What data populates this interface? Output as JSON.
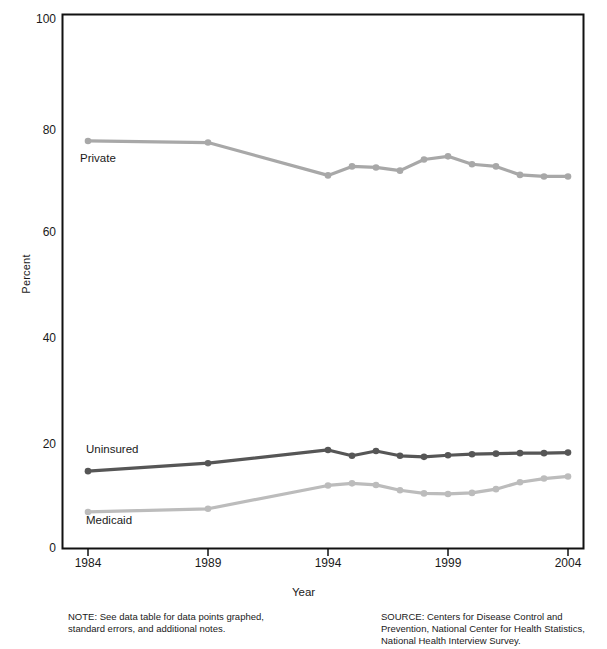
{
  "chart_data": {
    "type": "line",
    "title": "",
    "xlabel": "Year",
    "ylabel": "Percent",
    "ylim": [
      0,
      100
    ],
    "xlim": [
      1984,
      2004
    ],
    "yticks": [
      0,
      20,
      40,
      60,
      80,
      100
    ],
    "xticks": [
      1984,
      1989,
      1994,
      1999,
      2004
    ],
    "grid": false,
    "legend_position": "inline-labels",
    "x": [
      1984,
      1989,
      1994,
      1995,
      1996,
      1997,
      1998,
      1999,
      2000,
      2001,
      2002,
      2003,
      2004
    ],
    "series": [
      {
        "name": "Private",
        "color": "#a8a8a8",
        "values": [
          76.8,
          76.5,
          70.3,
          72.0,
          71.8,
          71.2,
          73.3,
          73.9,
          72.4,
          72.0,
          70.4,
          70.1,
          70.1
        ]
      },
      {
        "name": "Uninsured",
        "color": "#565656",
        "values": [
          14.5,
          16.0,
          18.5,
          17.4,
          18.3,
          17.4,
          17.2,
          17.5,
          17.7,
          17.8,
          17.9,
          17.9,
          18.0
        ]
      },
      {
        "name": "Medicaid",
        "color": "#bcbcbc",
        "values": [
          6.8,
          7.4,
          11.8,
          12.2,
          11.9,
          10.9,
          10.3,
          10.2,
          10.4,
          11.1,
          12.4,
          13.1,
          13.5
        ]
      }
    ]
  },
  "axis": {
    "ylabel": "Percent",
    "xlabel": "Year",
    "ytick_labels": [
      "0",
      "20",
      "40",
      "60",
      "80",
      "100"
    ],
    "xtick_labels": [
      "1984",
      "1989",
      "1994",
      "1999",
      "2004"
    ]
  },
  "series_labels": {
    "private": "Private",
    "uninsured": "Uninsured",
    "medicaid": "Medicaid"
  },
  "footnotes": {
    "note_line1": "NOTE: See data table for data points graphed,",
    "note_line2": "standard errors, and additional notes.",
    "source_line1": "SOURCE: Centers for Disease Control and",
    "source_line2": "Prevention, National Center for Health Statistics,",
    "source_line3": "National Health Interview Survey."
  },
  "colors": {
    "private": "#a8a8a8",
    "uninsured": "#565656",
    "medicaid": "#bcbcbc",
    "axis": "#111111",
    "background": "#ffffff"
  }
}
